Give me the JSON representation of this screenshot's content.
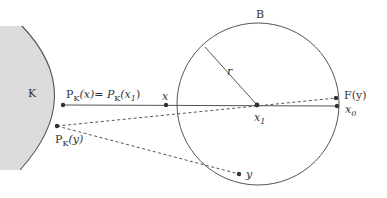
{
  "figure": {
    "width": 387,
    "height": 198,
    "colors": {
      "background": "#ffffff",
      "stroke": "#555555",
      "fill_K": "#dcdcdc",
      "text": "#333333"
    },
    "region_K": {
      "label": "K"
    },
    "ball_B": {
      "label": "B",
      "radius_label": "r",
      "center": [
        258,
        104
      ],
      "radius": 81
    },
    "points": {
      "PKx": {
        "label_main": "P",
        "label_sub": "K",
        "label_arg": "(x)= P",
        "label_sub2": "K",
        "label_arg2": "(x",
        "label_sub3": "1",
        "label_close": ")",
        "pos": [
          63,
          105
        ]
      },
      "PKy": {
        "label_main": "P",
        "label_sub": "K",
        "label_arg": "(y)",
        "pos": [
          57,
          126
        ]
      },
      "x": {
        "label": "x",
        "pos": [
          166,
          105
        ]
      },
      "x1": {
        "label": "x",
        "label_sub": "1",
        "pos": [
          257,
          105
        ]
      },
      "x0": {
        "label": "x",
        "label_sub": "0",
        "pos": [
          337,
          106
        ]
      },
      "Fy": {
        "label": "F(y)",
        "pos": [
          336,
          98
        ]
      },
      "y": {
        "label": "y",
        "pos": [
          239,
          174
        ]
      }
    },
    "segments": [
      {
        "from": "PKx",
        "to": "x0",
        "style": "solid"
      },
      {
        "from": "x1",
        "to": "radius_end",
        "style": "solid",
        "label": "r"
      },
      {
        "from": "PKy",
        "to": "Fy",
        "style": "dashed"
      },
      {
        "from": "PKy",
        "to": "y",
        "style": "dashed"
      },
      {
        "from": "x1",
        "to": "Fy",
        "style": "dashed"
      }
    ]
  }
}
